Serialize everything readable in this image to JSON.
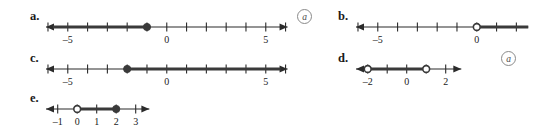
{
  "figure": {
    "type": "number-line-set",
    "colors": {
      "line": "#2b2b2b",
      "highlight": "#3a3a3a",
      "text": "#1a1a1a",
      "circle_annotation": "#8a8a8a",
      "background": "#ffffff"
    },
    "annotation_symbol": "a"
  },
  "rows": [
    {
      "id": "a",
      "label": "a.",
      "annotation": "a",
      "has_annotation": true,
      "axis_min": -6.1,
      "axis_max": 6.1,
      "left_arrow": true,
      "right_arrow": true,
      "ticks": [
        -6,
        -5,
        -4,
        -3,
        -2,
        -1,
        0,
        1,
        2,
        3,
        4,
        5,
        6
      ],
      "tick_labels": [
        {
          "value": -5,
          "text": "–5"
        },
        {
          "value": 0,
          "text": "0"
        },
        {
          "value": 5,
          "text": "5"
        }
      ],
      "points": [
        {
          "value": -1,
          "style": "filled"
        }
      ],
      "rays": [
        {
          "from": -6.1,
          "to": -1,
          "arrow_end": "left"
        }
      ],
      "segments": []
    },
    {
      "id": "b",
      "label": "b.",
      "annotation": "",
      "has_annotation": false,
      "axis_min": -6.1,
      "axis_max": 2.6,
      "left_arrow": true,
      "right_arrow": false,
      "ticks": [
        -6,
        -5,
        -4,
        -3,
        -2,
        -1,
        0,
        1,
        2
      ],
      "tick_labels": [
        {
          "value": -5,
          "text": "–5"
        },
        {
          "value": 0,
          "text": "0"
        }
      ],
      "points": [
        {
          "value": 0,
          "style": "open"
        }
      ],
      "rays": [
        {
          "from": 0,
          "to": 2.6,
          "arrow_end": "none"
        }
      ],
      "segments": []
    },
    {
      "id": "c",
      "label": "c.",
      "annotation": "",
      "has_annotation": false,
      "axis_min": -6.1,
      "axis_max": 6.1,
      "left_arrow": true,
      "right_arrow": true,
      "ticks": [
        -6,
        -5,
        -4,
        -3,
        -2,
        -1,
        0,
        1,
        2,
        3,
        4,
        5,
        6
      ],
      "tick_labels": [
        {
          "value": -5,
          "text": "–5"
        },
        {
          "value": 0,
          "text": "0"
        },
        {
          "value": 5,
          "text": "5"
        }
      ],
      "points": [
        {
          "value": -2,
          "style": "filled"
        }
      ],
      "rays": [
        {
          "from": -2,
          "to": 6.1,
          "arrow_end": "right"
        }
      ],
      "segments": []
    },
    {
      "id": "d",
      "label": "d.",
      "annotation": "a",
      "has_annotation": true,
      "axis_min": -2.6,
      "axis_max": 2.8,
      "left_arrow": true,
      "right_arrow": true,
      "ticks": [
        -2,
        -1,
        0,
        1,
        2
      ],
      "tick_labels": [
        {
          "value": -2,
          "text": "–2"
        },
        {
          "value": 0,
          "text": "0"
        },
        {
          "value": 2,
          "text": "2"
        }
      ],
      "points": [
        {
          "value": -2,
          "style": "open"
        },
        {
          "value": 1,
          "style": "open"
        }
      ],
      "rays": [],
      "segments": [
        {
          "from": -2,
          "to": 1
        }
      ]
    },
    {
      "id": "e",
      "label": "e.",
      "annotation": "",
      "has_annotation": false,
      "axis_min": -1.6,
      "axis_max": 3.7,
      "left_arrow": true,
      "right_arrow": true,
      "ticks": [
        -1,
        0,
        1,
        2,
        3
      ],
      "tick_labels": [
        {
          "value": -1,
          "text": "–1"
        },
        {
          "value": 0,
          "text": "0"
        },
        {
          "value": 1,
          "text": "1"
        },
        {
          "value": 2,
          "text": "2"
        },
        {
          "value": 3,
          "text": "3"
        }
      ],
      "points": [
        {
          "value": 0,
          "style": "open"
        },
        {
          "value": 2,
          "style": "filled"
        }
      ],
      "rays": [],
      "segments": [
        {
          "from": 0,
          "to": 2
        }
      ]
    }
  ],
  "layout": {
    "rows": [
      {
        "id": "a",
        "label_x": 30,
        "label_y": 10,
        "line_x": 46,
        "line_y": 17,
        "unit": 19.8,
        "origin_offset": 6.1,
        "ann_x": 297,
        "ann_y": 9
      },
      {
        "id": "b",
        "label_x": 338,
        "label_y": 10,
        "line_x": 356,
        "line_y": 17,
        "unit": 19.8,
        "origin_offset": 6.1,
        "ann_x": 0,
        "ann_y": 0
      },
      {
        "id": "c",
        "label_x": 30,
        "label_y": 52,
        "line_x": 46,
        "line_y": 59,
        "unit": 19.8,
        "origin_offset": 6.1,
        "ann_x": 0,
        "ann_y": 0
      },
      {
        "id": "d",
        "label_x": 338,
        "label_y": 52,
        "line_x": 356,
        "line_y": 59,
        "unit": 19.5,
        "origin_offset": 2.6,
        "ann_x": 501,
        "ann_y": 51
      },
      {
        "id": "e",
        "label_x": 30,
        "label_y": 92,
        "line_x": 46,
        "line_y": 99,
        "unit": 19.5,
        "origin_offset": 1.6,
        "ann_x": 0,
        "ann_y": 0
      }
    ]
  }
}
